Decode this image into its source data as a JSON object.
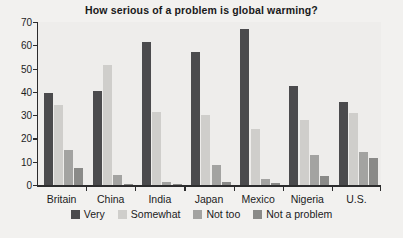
{
  "chart_data": {
    "type": "bar",
    "title": "How serious of a problem is global warming?",
    "xlabel": "",
    "ylabel": "",
    "ylim": [
      0,
      70
    ],
    "yticks": [
      0,
      10,
      20,
      30,
      40,
      50,
      60,
      70
    ],
    "grid": false,
    "legend_position": "bottom",
    "categories": [
      "Britain",
      "China",
      "India",
      "Japan",
      "Mexico",
      "Nigeria",
      "U.S."
    ],
    "series": [
      {
        "name": "Very",
        "color": "#4b4b4d",
        "values": [
          39.5,
          40.5,
          61.5,
          57,
          67,
          42.5,
          35.5
        ]
      },
      {
        "name": "Somewhat",
        "color": "#cfcecb",
        "values": [
          34.5,
          51.5,
          31.5,
          30,
          24,
          28,
          31
        ]
      },
      {
        "name": "Not too",
        "color": "#a3a3a1",
        "values": [
          15,
          4.5,
          1.5,
          8.5,
          2.5,
          13,
          14
        ]
      },
      {
        "name": "Not a problem",
        "color": "#8a8a88",
        "values": [
          7.5,
          0.4,
          0.5,
          1.5,
          1,
          4,
          11.5
        ]
      }
    ]
  },
  "legend": {
    "items": [
      {
        "label": "Very"
      },
      {
        "label": "Somewhat"
      },
      {
        "label": "Not too"
      },
      {
        "label": "Not a problem"
      }
    ]
  }
}
